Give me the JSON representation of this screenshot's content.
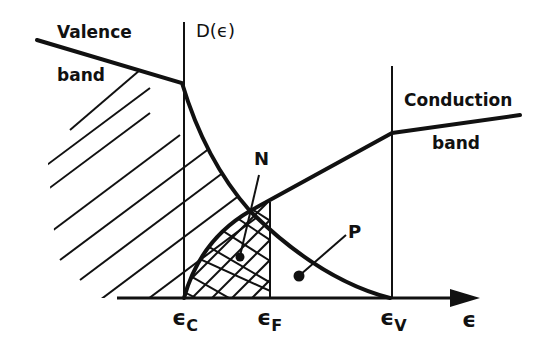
{
  "labels": {
    "valence_1": "Valence",
    "valence_2": "band",
    "conduction_1": "Conduction",
    "conduction_2": "band",
    "y_axis": "D(ϵ)",
    "x_axis": "ϵ",
    "N": "N",
    "P": "P"
  },
  "ticks": [
    {
      "sym": "ϵ",
      "sub": "C"
    },
    {
      "sym": "ϵ",
      "sub": "F"
    },
    {
      "sym": "ϵ",
      "sub": "V"
    }
  ],
  "colors": {
    "ink": "#111111",
    "background": "#ffffff"
  }
}
